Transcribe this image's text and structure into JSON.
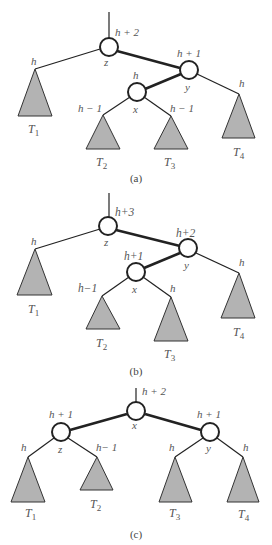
{
  "figure": {
    "panels": [
      {
        "caption": "(a)",
        "root_label": "h + 2",
        "nodes": {
          "z": {
            "name": "z",
            "height": "h + 2"
          },
          "y": {
            "name": "y",
            "height": "h + 1"
          },
          "x": {
            "name": "x",
            "height": "h"
          }
        },
        "subtrees": [
          {
            "name": "T1",
            "sub": "1",
            "height": "h"
          },
          {
            "name": "T2",
            "sub": "2",
            "height": "h − 1"
          },
          {
            "name": "T3",
            "sub": "3",
            "height": "h − 1"
          },
          {
            "name": "T4",
            "sub": "4",
            "height": "h"
          }
        ]
      },
      {
        "caption": "(b)",
        "root_label": "h+3",
        "nodes": {
          "z": {
            "name": "z",
            "height": "h+3"
          },
          "y": {
            "name": "y",
            "height": "h+2"
          },
          "x": {
            "name": "x",
            "height": "h+1"
          }
        },
        "subtrees": [
          {
            "name": "T1",
            "sub": "1",
            "height": "h"
          },
          {
            "name": "T2",
            "sub": "2",
            "height": "h−1"
          },
          {
            "name": "T3",
            "sub": "3",
            "height": "h"
          },
          {
            "name": "T4",
            "sub": "4",
            "height": "h"
          }
        ]
      },
      {
        "caption": "(c)",
        "root_label": "h + 2",
        "nodes": {
          "x": {
            "name": "x",
            "height": "h + 2"
          },
          "z": {
            "name": "z",
            "height": "h + 1"
          },
          "y": {
            "name": "y",
            "height": "h + 1"
          }
        },
        "subtrees": [
          {
            "name": "T1",
            "sub": "1",
            "height": "h"
          },
          {
            "name": "T2",
            "sub": "2",
            "height": "h− 1"
          },
          {
            "name": "T3",
            "sub": "3",
            "height": "h"
          },
          {
            "name": "T4",
            "sub": "4",
            "height": "h"
          }
        ]
      }
    ],
    "subtree_letter": "T"
  }
}
